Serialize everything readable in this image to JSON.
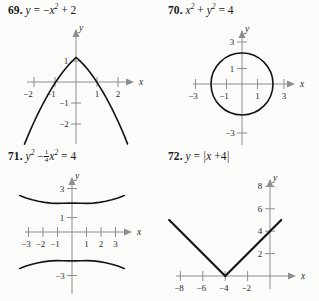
{
  "page": {
    "background": "#fbfbfa",
    "ink": "#141414",
    "axis_color": "#8e8e8e"
  },
  "problems": [
    {
      "number": "69.",
      "equation_plain": "y = -x^2 + 2",
      "equation_parts": {
        "lhs": "y",
        "eq": "=",
        "neg": "−",
        "base": "x",
        "exp": "2",
        "plus": "+",
        "const": "2"
      },
      "graph": {
        "type": "parabola-down",
        "x_ticks": [
          "−2",
          "−1",
          "1",
          "2"
        ],
        "y_ticks": [
          "1",
          "−1",
          "−2"
        ],
        "x_axis_label": "x",
        "y_axis_label": "y",
        "vertex": [
          0,
          2
        ],
        "x_range": [
          -2.6,
          2.6
        ],
        "y_range": [
          -3.0,
          2.6
        ]
      }
    },
    {
      "number": "70.",
      "equation_plain": "x^2 + y^2 = 4",
      "equation_parts": {
        "base1": "x",
        "exp1": "2",
        "plus": "+",
        "base2": "y",
        "exp2": "2",
        "eq": "=",
        "rhs": "4"
      },
      "graph": {
        "type": "circle",
        "x_ticks": [
          "−3",
          "−1",
          "1",
          "3"
        ],
        "y_ticks": [
          "3",
          "1",
          "−3"
        ],
        "x_axis_label": "x",
        "y_axis_label": "y",
        "center": [
          0,
          0
        ],
        "radius": 2,
        "x_range": [
          -3.8,
          3.8
        ],
        "y_range": [
          -3.8,
          3.8
        ]
      }
    },
    {
      "number": "71.",
      "equation_plain": "y^2 - (1/4)x^2 = 4",
      "equation_parts": {
        "base1": "y",
        "exp1": "2",
        "minus": "−",
        "frac_num": "1",
        "frac_den": "4",
        "base2": "x",
        "exp2": "2",
        "eq": "=",
        "rhs": "4"
      },
      "graph": {
        "type": "hyperbola-vertical",
        "x_ticks": [
          "−3",
          "−2",
          "−1",
          "1",
          "2",
          "3"
        ],
        "y_ticks": [
          "3",
          "1",
          "−3"
        ],
        "x_axis_label": "x",
        "y_axis_label": "y",
        "vertices": [
          [
            0,
            2
          ],
          [
            0,
            -2
          ]
        ],
        "a": 2,
        "b": 4,
        "x_range": [
          -4.0,
          4.0
        ],
        "y_range": [
          -4.2,
          4.2
        ]
      }
    },
    {
      "number": "72.",
      "equation_plain": "y = |x + 4|",
      "equation_parts": {
        "lhs": "y",
        "eq": "=",
        "bar_open": "|",
        "base": "x",
        "plus": "+",
        "const": "4",
        "bar_close": "|"
      },
      "graph": {
        "type": "absolute-value",
        "x_ticks": [
          "−8",
          "−6",
          "−4",
          "−2"
        ],
        "y_ticks": [
          "2",
          "4",
          "6",
          "8"
        ],
        "x_axis_label": "x",
        "y_axis_label": "y",
        "vertex": [
          -4,
          0
        ],
        "x_range": [
          -10.0,
          2.0
        ],
        "y_range": [
          -1.4,
          9.6
        ]
      }
    }
  ]
}
